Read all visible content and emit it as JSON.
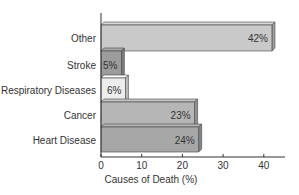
{
  "chart_data": {
    "type": "bar",
    "orientation": "horizontal",
    "title": "",
    "xlabel": "Causes of Death (%)",
    "ylabel": "",
    "categories": [
      "Other",
      "Stroke",
      "Respiratory Diseases",
      "Cancer",
      "Heart Disease"
    ],
    "values": [
      42,
      5,
      6,
      23,
      24
    ],
    "value_labels": [
      "42%",
      "5%",
      "6%",
      "23%",
      "24%"
    ],
    "bar_colors": [
      "#c9c9c9",
      "#9c9c9c",
      "#ededed",
      "#b6b6b6",
      "#a7a7a7"
    ],
    "xlim": [
      0,
      45
    ],
    "xticks": [
      0,
      10,
      20,
      30,
      40
    ],
    "xtick_labels": [
      "0",
      "10",
      "20",
      "30",
      "40"
    ],
    "grid": false,
    "legend": null,
    "style": "3d-bars"
  }
}
